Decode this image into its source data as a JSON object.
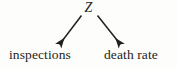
{
  "diagram": {
    "kind": "causal-dag",
    "background_color": "#fdfdfc",
    "ink_color": "#231f20",
    "nodes": {
      "confounder": {
        "label": "Z",
        "style": "italic",
        "role": "common-cause"
      },
      "left_outcome": {
        "label": "inspections",
        "style": "roman",
        "role": "effect"
      },
      "right_outcome": {
        "label": "death rate",
        "style": "roman",
        "role": "effect"
      }
    },
    "edges": [
      {
        "id": "z-to-inspections",
        "from": "Z",
        "to": "inspections",
        "arrowhead": "filled-triangle",
        "direction": "down-left"
      },
      {
        "id": "z-to-death-rate",
        "from": "Z",
        "to": "death rate",
        "arrowhead": "filled-triangle",
        "direction": "down-right"
      }
    ]
  }
}
